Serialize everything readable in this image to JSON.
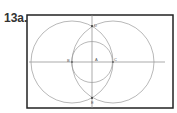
{
  "figure": {
    "label": "13a.",
    "points": {
      "top": "D",
      "left": "B",
      "center": "A",
      "right": "C",
      "bottom": "E"
    },
    "colors": {
      "frame": "#222222",
      "circle": "#9a9a9a",
      "axis": "#888888"
    }
  }
}
